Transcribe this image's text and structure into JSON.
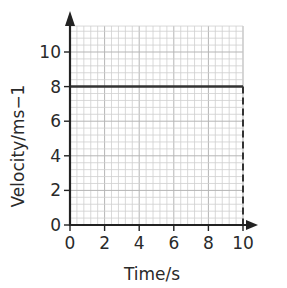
{
  "chart_data": {
    "type": "line",
    "title": "",
    "xlabel": "Time/s",
    "ylabel": "Velocity/ms−1",
    "xlim": [
      0,
      10
    ],
    "ylim": [
      0,
      11.5
    ],
    "x_ticks": [
      0,
      2,
      4,
      6,
      8,
      10
    ],
    "y_ticks": [
      0,
      2,
      4,
      6,
      8,
      10
    ],
    "grid": true,
    "series": [
      {
        "name": "velocity",
        "style": "solid",
        "x": [
          0,
          10
        ],
        "y": [
          8,
          8
        ]
      },
      {
        "name": "drop-line",
        "style": "dashed",
        "x": [
          10,
          10
        ],
        "y": [
          8,
          0
        ]
      }
    ]
  },
  "colors": {
    "axis": "#222222",
    "line": "#333333",
    "grid_minor": "#cfcfcf",
    "grid_major": "#b5b5b5"
  }
}
